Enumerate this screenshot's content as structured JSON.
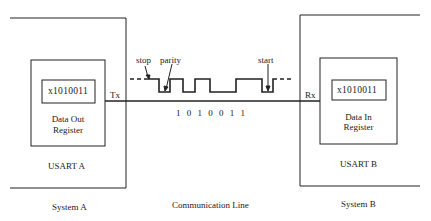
{
  "system_a": {
    "label": "System A",
    "usart_label": "USART A",
    "register_value": "x1010011",
    "register_label_line1": "Data Out",
    "register_label_line2": "Register",
    "pin_label": "Tx"
  },
  "system_b": {
    "label": "System B",
    "usart_label": "USART B",
    "register_value": "x1010011",
    "register_label_line1": "Data In",
    "register_label_line2": "Register",
    "pin_label": "Rx"
  },
  "line": {
    "label": "Communication Line",
    "bits": "1 0 1 0 0 1 1",
    "annotations": {
      "stop": "stop",
      "parity": "parity",
      "start": "start"
    }
  },
  "colors": {
    "stroke": "#222222",
    "background": "#ffffff"
  }
}
